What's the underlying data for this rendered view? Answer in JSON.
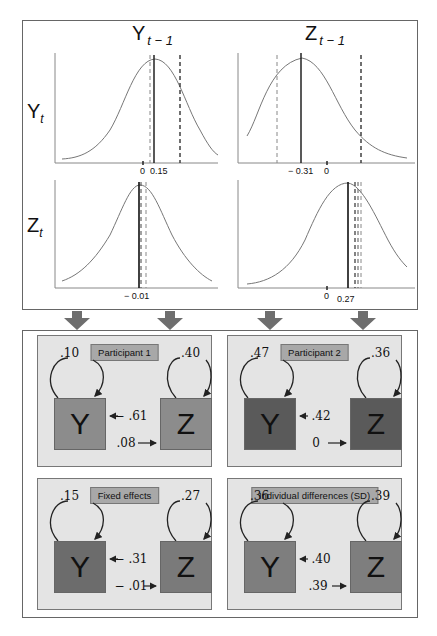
{
  "figure": {
    "columns": [
      {
        "label_main": "Y",
        "label_sub": "t − 1"
      },
      {
        "label_main": "Z",
        "label_sub": "t − 1"
      }
    ],
    "rows": [
      {
        "label_main": "Y",
        "label_sub": "t"
      },
      {
        "label_main": "Z",
        "label_sub": "t"
      }
    ],
    "distribution_plots": [
      {
        "id": "Yt_on_Yt-1",
        "mean_label": "0.15",
        "zero_label": "0",
        "mean": 0.15,
        "zero": 0
      },
      {
        "id": "Yt_on_Zt-1",
        "mean_label": "− 0.31",
        "zero_label": "0",
        "mean": -0.31,
        "zero": 0
      },
      {
        "id": "Zt_on_Yt-1",
        "mean_label": "− 0.01",
        "mean": -0.01
      },
      {
        "id": "Zt_on_Zt-1",
        "mean_label": "0.27",
        "zero_label": "0",
        "mean": 0.27,
        "zero": 0
      }
    ],
    "arrow_color": "#6e6e6e"
  },
  "panels": [
    {
      "title": "Participant 1",
      "y_autoreg": ".10",
      "z_autoreg": ".40",
      "z_to_y": "− .61",
      "y_to_z": ".08",
      "y_label": "Y",
      "z_label": "Z",
      "y_color": "#8c8c8c",
      "z_color": "#8c8c8c"
    },
    {
      "title": "Participant 2",
      "y_autoreg": ".47",
      "z_autoreg": ".36",
      "z_to_y": ".42",
      "y_to_z": "0",
      "y_label": "Y",
      "z_label": "Z",
      "y_color": "#5a5a5a",
      "z_color": "#5a5a5a"
    },
    {
      "title": "Fixed effects",
      "y_autoreg": ".15",
      "z_autoreg": ".27",
      "z_to_y": "− .31",
      "y_to_z": "− .01",
      "y_label": "Y",
      "z_label": "Z",
      "y_color": "#6c6c6c",
      "z_color": "#7a7a7a"
    },
    {
      "title": "Individual differences (SD)",
      "y_autoreg": ".36",
      "z_autoreg": ".39",
      "z_to_y": ".40",
      "y_to_z": ".39",
      "y_label": "Y",
      "z_label": "Z",
      "y_color": "#7e7e7e",
      "z_color": "#7e7e7e"
    }
  ]
}
